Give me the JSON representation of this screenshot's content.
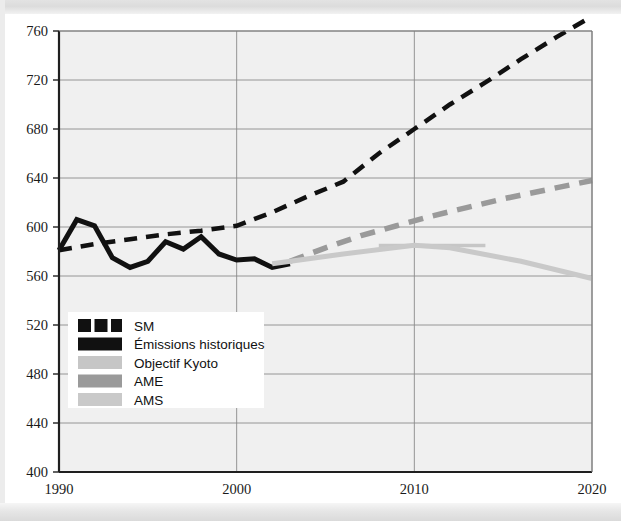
{
  "chart_data": {
    "type": "line",
    "title": "",
    "xlabel": "",
    "ylabel": "",
    "xlim": [
      1990,
      2020
    ],
    "ylim": [
      400,
      760
    ],
    "grid": true,
    "legend_position": "lower-left-inside",
    "x_ticks": [
      "1990",
      "2000",
      "2010",
      "2020"
    ],
    "x_tick_values": [
      1990,
      2000,
      2010,
      2020
    ],
    "y_ticks": [
      "400",
      "440",
      "480",
      "520",
      "560",
      "600",
      "640",
      "680",
      "720",
      "760"
    ],
    "y_tick_values": [
      400,
      440,
      480,
      520,
      560,
      600,
      640,
      680,
      720,
      760
    ],
    "series": [
      {
        "name": "SM",
        "style": "dashed",
        "color": "#111111",
        "width": 4.5,
        "x": [
          1990,
          1992,
          1994,
          1996,
          1998,
          2000,
          2002,
          2004,
          2006,
          2008,
          2010,
          2012,
          2014,
          2016,
          2018,
          2020
        ],
        "values": [
          581,
          586,
          590,
          594,
          597,
          601,
          612,
          625,
          637,
          660,
          680,
          700,
          718,
          737,
          755,
          772
        ]
      },
      {
        "name": "Émissions historiques",
        "style": "solid",
        "color": "#111111",
        "width": 5.0,
        "x": [
          1990,
          1991,
          1992,
          1993,
          1994,
          1995,
          1996,
          1997,
          1998,
          1999,
          2000,
          2001,
          2002,
          2003
        ],
        "values": [
          581,
          606,
          601,
          575,
          567,
          572,
          588,
          582,
          592,
          578,
          573,
          574,
          567,
          570
        ]
      },
      {
        "name": "Objectif Kyoto",
        "style": "solid",
        "color": "#c6c6c6",
        "width": 3.5,
        "x": [
          2008,
          2014
        ],
        "values": [
          585,
          585
        ]
      },
      {
        "name": "AME",
        "style": "dashed",
        "color": "#9a9a9a",
        "width": 5.5,
        "x": [
          2003,
          2005,
          2007,
          2009,
          2011,
          2013,
          2015,
          2017,
          2019,
          2020
        ],
        "values": [
          572,
          583,
          593,
          601,
          609,
          616,
          623,
          629,
          635,
          638
        ]
      },
      {
        "name": "AMS",
        "style": "solid",
        "color": "#c9c9c9",
        "width": 5.0,
        "x": [
          2002,
          2006,
          2010,
          2012,
          2016,
          2020
        ],
        "values": [
          570,
          578,
          585,
          583,
          572,
          558
        ]
      }
    ]
  },
  "legend": {
    "items": [
      {
        "label": "SM",
        "swatch": "dashed-black"
      },
      {
        "label": "Émissions historiques",
        "swatch": "solid-black"
      },
      {
        "label": "Objectif Kyoto",
        "swatch": "solid-light-gray"
      },
      {
        "label": "AME",
        "swatch": "solid-medium-gray"
      },
      {
        "label": "AMS",
        "swatch": "solid-light-gray2"
      }
    ]
  },
  "colors": {
    "plot_background": "#f0f0f0",
    "grid": "#8a8a8a",
    "axis": "#1f1f1f",
    "black_series": "#111111",
    "ame_gray": "#9a9a9a",
    "ams_gray": "#c9c9c9",
    "kyoto_gray": "#c6c6c6",
    "page_background": "#ffffff"
  }
}
